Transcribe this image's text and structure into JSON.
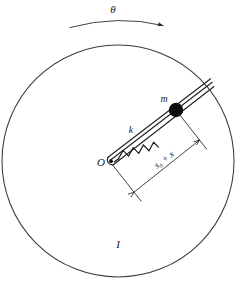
{
  "figure": {
    "labels": {
      "theta": "θ",
      "mass": "m",
      "spring_constant": "k",
      "origin": "O",
      "moment_of_inertia": "I",
      "displacement": "s₀ + x"
    },
    "icons": {
      "rotation_arc": "curved-arrow-icon",
      "mass_marker": "filled-circle-icon",
      "pivot_marker": "dot-icon",
      "spring": "zigzag-spring-icon",
      "dimension": "double-arrow-dimension-icon"
    },
    "geometry": {
      "disk_center_x": 118,
      "disk_center_y": 161,
      "disk_radius": 116,
      "pivot_x": 109,
      "pivot_y": 162,
      "rod_tip_x": 212,
      "rod_tip_y": 82,
      "mass_x": 176,
      "mass_y": 110,
      "mass_radius": 7.2,
      "rod_angle_deg": -37.5
    },
    "colors": {
      "background": "#ffffff",
      "ink": "#1f1f1f",
      "disk_outline": "#3a3a3a",
      "mass_fill": "#0d0d0d"
    }
  }
}
